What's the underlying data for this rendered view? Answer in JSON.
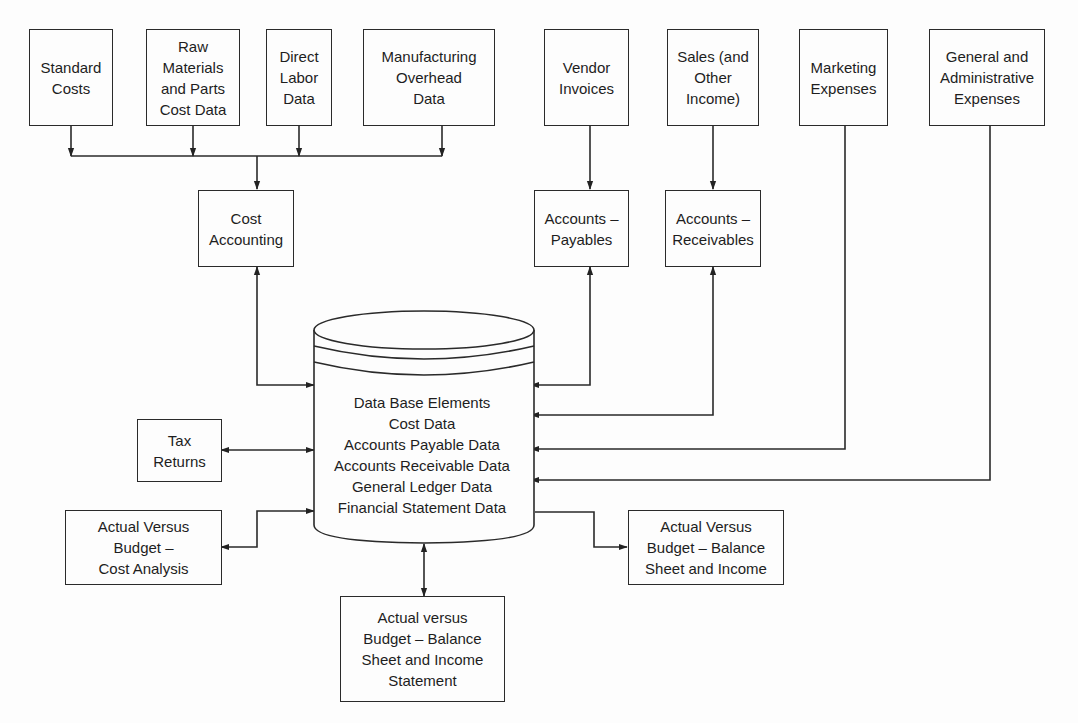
{
  "diagram": {
    "type": "data-flow",
    "inputs_top": [
      {
        "id": "standard_costs",
        "lines": [
          "Standard",
          "Costs"
        ]
      },
      {
        "id": "raw_materials",
        "lines": [
          "Raw",
          "Materials",
          "and Parts",
          "Cost Data"
        ]
      },
      {
        "id": "direct_labor",
        "lines": [
          "Direct",
          "Labor",
          "Data"
        ]
      },
      {
        "id": "manufacturing_overhead",
        "lines": [
          "Manufacturing",
          "Overhead",
          "Data"
        ]
      },
      {
        "id": "vendor_invoices",
        "lines": [
          "Vendor",
          "Invoices"
        ]
      },
      {
        "id": "sales",
        "lines": [
          "Sales (and",
          "Other",
          "Income)"
        ]
      },
      {
        "id": "marketing_expenses",
        "lines": [
          "Marketing",
          "Expenses"
        ]
      },
      {
        "id": "general_admin",
        "lines": [
          "General and",
          "Administrative",
          "Expenses"
        ]
      }
    ],
    "processes": [
      {
        "id": "cost_accounting",
        "lines": [
          "Cost",
          "Accounting"
        ]
      },
      {
        "id": "accounts_payables",
        "lines": [
          "Accounts –",
          "Payables"
        ]
      },
      {
        "id": "accounts_receivables",
        "lines": [
          "Accounts –",
          "Receivables"
        ]
      }
    ],
    "database": {
      "id": "data_base",
      "lines": [
        "Data Base Elements",
        "Cost Data",
        "Accounts Payable Data",
        "Accounts Receivable Data",
        "General Ledger Data",
        "Financial Statement Data"
      ]
    },
    "outputs": [
      {
        "id": "tax_returns",
        "lines": [
          "Tax",
          "Returns"
        ]
      },
      {
        "id": "avb_cost",
        "lines": [
          "Actual Versus",
          "Budget –",
          "Cost Analysis"
        ]
      },
      {
        "id": "avb_balance_right",
        "lines": [
          "Actual Versus",
          "Budget – Balance",
          "Sheet and Income"
        ]
      },
      {
        "id": "avb_balance_bottom",
        "lines": [
          "Actual versus",
          "Budget – Balance",
          "Sheet and Income",
          "Statement"
        ]
      }
    ],
    "edges": [
      {
        "from": "standard_costs",
        "to": "cost_accounting",
        "dir": "one-way"
      },
      {
        "from": "raw_materials",
        "to": "cost_accounting",
        "dir": "one-way"
      },
      {
        "from": "direct_labor",
        "to": "cost_accounting",
        "dir": "one-way"
      },
      {
        "from": "manufacturing_overhead",
        "to": "cost_accounting",
        "dir": "one-way"
      },
      {
        "from": "vendor_invoices",
        "to": "accounts_payables",
        "dir": "one-way"
      },
      {
        "from": "sales",
        "to": "accounts_receivables",
        "dir": "one-way"
      },
      {
        "from": "cost_accounting",
        "to": "data_base",
        "dir": "two-way"
      },
      {
        "from": "accounts_payables",
        "to": "data_base",
        "dir": "two-way"
      },
      {
        "from": "accounts_receivables",
        "to": "data_base",
        "dir": "two-way"
      },
      {
        "from": "marketing_expenses",
        "to": "data_base",
        "dir": "one-way"
      },
      {
        "from": "general_admin",
        "to": "data_base",
        "dir": "one-way"
      },
      {
        "from": "tax_returns",
        "to": "data_base",
        "dir": "two-way"
      },
      {
        "from": "avb_cost",
        "to": "data_base",
        "dir": "two-way"
      },
      {
        "from": "data_base",
        "to": "avb_balance_right",
        "dir": "one-way"
      },
      {
        "from": "data_base",
        "to": "avb_balance_bottom",
        "dir": "two-way"
      }
    ]
  }
}
